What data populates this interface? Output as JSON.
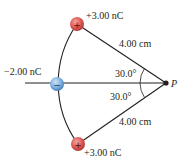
{
  "diagram": {
    "charges": {
      "top": {
        "label": "+3.00 nC",
        "sign": "+",
        "color": "#d9534f"
      },
      "middle": {
        "label": "−2.00 nC",
        "sign": "−",
        "color": "#6fa8dc"
      },
      "bottom": {
        "label": "+3.00 nC",
        "sign": "+",
        "color": "#d9534f"
      }
    },
    "distances": {
      "top": "4.00 cm",
      "bottom": "4.00 cm"
    },
    "angles": {
      "upper": "30.0°",
      "lower": "30.0°"
    },
    "point": {
      "label": "P"
    },
    "colors": {
      "line": "#231f20",
      "positive": "#d9534f",
      "negative": "#6fa8dc"
    }
  }
}
